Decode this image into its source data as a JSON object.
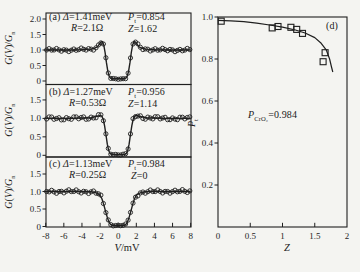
{
  "figure": {
    "background_color": "#f4f4f1",
    "ink_color": "#1f1f1f"
  },
  "axis_labels": {
    "left_y_html": "<i>G</i>(<i>V</i>)/<i>G</i><sub>n</sub>",
    "left_x_html": "<i>V</i>/mV",
    "d_y_html": "<i>P</i><sub>t</sub>",
    "d_x_html": "<i>Z</i>"
  },
  "chart_data": [
    {
      "type": "line",
      "panel": "a",
      "title_html": "(a) <i>Δ</i>=1.41meV",
      "pt_html": "<i>P</i><sub>t</sub>=0.854",
      "r_html": "<i>R</i>=2.1Ω",
      "z_html": "<i>Z</i>=1.62",
      "params": {
        "delta_meV": 1.41,
        "P_t": 0.854,
        "R_ohm": 2.1,
        "Z": 1.62
      },
      "xlabel": "V/mV",
      "ylabel": "G(V)/Gn",
      "xlim": [
        -8,
        8
      ],
      "ylim": [
        0,
        2.2
      ],
      "xticks": [
        -8,
        -6,
        -4,
        -2,
        0,
        2,
        4,
        6,
        8
      ],
      "xtick_labels": [
        "-8",
        "-6",
        "-4",
        "-2",
        "0",
        "2",
        "4",
        "6",
        "8"
      ],
      "yticks": [
        0,
        0.5,
        1,
        1.5,
        2
      ],
      "ytick_labels": [
        "0",
        "0.5",
        "1.0",
        "1.5",
        "2.0"
      ],
      "curve": [
        [
          -8,
          1.0
        ],
        [
          -7,
          1.0
        ],
        [
          -6,
          1.0
        ],
        [
          -5,
          1.0
        ],
        [
          -4,
          1.01
        ],
        [
          -3.5,
          1.02
        ],
        [
          -3,
          1.03
        ],
        [
          -2.6,
          1.06
        ],
        [
          -2.3,
          1.1
        ],
        [
          -2.05,
          1.2
        ],
        [
          -1.9,
          1.26
        ],
        [
          -1.75,
          1.27
        ],
        [
          -1.6,
          1.17
        ],
        [
          -1.45,
          0.92
        ],
        [
          -1.3,
          0.6
        ],
        [
          -1.15,
          0.32
        ],
        [
          -1.0,
          0.16
        ],
        [
          -0.85,
          0.09
        ],
        [
          -0.7,
          0.075
        ],
        [
          -0.5,
          0.07
        ],
        [
          0,
          0.07
        ],
        [
          0.5,
          0.07
        ],
        [
          0.7,
          0.075
        ],
        [
          0.85,
          0.09
        ],
        [
          1.0,
          0.16
        ],
        [
          1.15,
          0.32
        ],
        [
          1.3,
          0.6
        ],
        [
          1.45,
          0.92
        ],
        [
          1.6,
          1.17
        ],
        [
          1.75,
          1.27
        ],
        [
          1.9,
          1.26
        ],
        [
          2.05,
          1.2
        ],
        [
          2.3,
          1.1
        ],
        [
          2.6,
          1.06
        ],
        [
          3,
          1.03
        ],
        [
          3.5,
          1.02
        ],
        [
          4,
          1.01
        ],
        [
          5,
          1.0
        ],
        [
          6,
          1.0
        ],
        [
          7,
          1.0
        ],
        [
          8,
          1.0
        ]
      ]
    },
    {
      "type": "line",
      "panel": "b",
      "title_html": "(b) <i>Δ</i>=1.27meV",
      "pt_html": "<i>P</i><sub>t</sub>=0.956",
      "r_html": "<i>R</i>=0.53Ω",
      "z_html": "<i>Z</i>=1.14",
      "params": {
        "delta_meV": 1.27,
        "P_t": 0.956,
        "R_ohm": 0.53,
        "Z": 1.14
      },
      "xlabel": "V/mV",
      "ylabel": "G(V)/Gn",
      "xlim": [
        -8,
        8
      ],
      "ylim": [
        0,
        1.95
      ],
      "xticks": [
        -8,
        -6,
        -4,
        -2,
        0,
        2,
        4,
        6,
        8
      ],
      "xtick_labels": [
        "-8",
        "-6",
        "-4",
        "-2",
        "0",
        "2",
        "4",
        "6",
        "8"
      ],
      "yticks": [
        0,
        0.5,
        1,
        1.5
      ],
      "ytick_labels": [
        "0",
        "0.5",
        "1.0",
        "1.5"
      ],
      "curve": [
        [
          -8,
          1.0
        ],
        [
          -7,
          1.0
        ],
        [
          -6,
          1.0
        ],
        [
          -5,
          1.0
        ],
        [
          -4,
          1.01
        ],
        [
          -3,
          1.02
        ],
        [
          -2.6,
          1.04
        ],
        [
          -2.2,
          1.065
        ],
        [
          -2.0,
          1.08
        ],
        [
          -1.8,
          1.06
        ],
        [
          -1.65,
          0.97
        ],
        [
          -1.5,
          0.8
        ],
        [
          -1.35,
          0.55
        ],
        [
          -1.2,
          0.3
        ],
        [
          -1.05,
          0.13
        ],
        [
          -0.9,
          0.05
        ],
        [
          -0.7,
          0.025
        ],
        [
          -0.4,
          0.02
        ],
        [
          0,
          0.02
        ],
        [
          0.4,
          0.02
        ],
        [
          0.7,
          0.025
        ],
        [
          0.9,
          0.05
        ],
        [
          1.05,
          0.13
        ],
        [
          1.2,
          0.3
        ],
        [
          1.35,
          0.55
        ],
        [
          1.5,
          0.8
        ],
        [
          1.65,
          0.97
        ],
        [
          1.8,
          1.06
        ],
        [
          2.0,
          1.08
        ],
        [
          2.2,
          1.065
        ],
        [
          2.6,
          1.04
        ],
        [
          3,
          1.02
        ],
        [
          4,
          1.01
        ],
        [
          5,
          1.0
        ],
        [
          6,
          1.0
        ],
        [
          7,
          1.0
        ],
        [
          8,
          1.0
        ]
      ]
    },
    {
      "type": "line",
      "panel": "c",
      "title_html": "(c) <i>Δ</i>=1.13meV",
      "pt_html": "<i>P</i><sub>t</sub>=0.984",
      "r_html": "<i>R</i>=0.25Ω",
      "z_html": "<i>Z</i>=0",
      "params": {
        "delta_meV": 1.13,
        "P_t": 0.984,
        "R_ohm": 0.25,
        "Z": 0
      },
      "xlabel": "V/mV",
      "ylabel": "G(V)/Gn",
      "xlim": [
        -8,
        8
      ],
      "ylim": [
        0,
        2.0
      ],
      "xticks": [
        -8,
        -6,
        -4,
        -2,
        0,
        2,
        4,
        6,
        8
      ],
      "xtick_labels": [
        "-8",
        "-6",
        "-4",
        "-2",
        "0",
        "2",
        "4",
        "6",
        "8"
      ],
      "yticks": [
        0,
        0.5,
        1,
        1.5
      ],
      "ytick_labels": [
        "0",
        "0.5",
        "1.0",
        "1.5"
      ],
      "curve": [
        [
          -8,
          1.0
        ],
        [
          -7,
          1.0
        ],
        [
          -6,
          1.0
        ],
        [
          -5,
          1.0
        ],
        [
          -4,
          1.0
        ],
        [
          -3,
          0.99
        ],
        [
          -2.6,
          0.975
        ],
        [
          -2.3,
          0.95
        ],
        [
          -2.0,
          0.89
        ],
        [
          -1.8,
          0.79
        ],
        [
          -1.6,
          0.63
        ],
        [
          -1.4,
          0.44
        ],
        [
          -1.2,
          0.26
        ],
        [
          -1.0,
          0.12
        ],
        [
          -0.85,
          0.06
        ],
        [
          -0.65,
          0.035
        ],
        [
          -0.4,
          0.03
        ],
        [
          0,
          0.03
        ],
        [
          0.4,
          0.03
        ],
        [
          0.65,
          0.035
        ],
        [
          0.85,
          0.06
        ],
        [
          1.0,
          0.12
        ],
        [
          1.2,
          0.26
        ],
        [
          1.4,
          0.44
        ],
        [
          1.6,
          0.63
        ],
        [
          1.8,
          0.79
        ],
        [
          2.0,
          0.89
        ],
        [
          2.3,
          0.95
        ],
        [
          2.6,
          0.975
        ],
        [
          3,
          0.99
        ],
        [
          4,
          1.0
        ],
        [
          5,
          1.0
        ],
        [
          6,
          1.0
        ],
        [
          7,
          1.0
        ],
        [
          8,
          1.0
        ]
      ]
    },
    {
      "type": "scatter",
      "panel": "d",
      "label_html": "(d)",
      "annotation_html": "<i>P</i><sub>CrO₂</sub>=0.984",
      "annotation_text": "P_CrO2=0.984",
      "xlabel": "Z",
      "ylabel": "Pt",
      "xlim": [
        0,
        2
      ],
      "ylim": [
        0,
        1.05
      ],
      "xticks": [
        0,
        0.5,
        1,
        1.5,
        2
      ],
      "xtick_labels": [
        "0",
        "0.5",
        "1",
        "1.5",
        "2"
      ],
      "yticks": [
        0.2,
        0.4,
        0.6,
        0.8,
        1.0
      ],
      "ytick_labels": [
        "0.2",
        "0.4",
        "0.6",
        "0.8",
        "1.0"
      ],
      "squares": [
        [
          0.05,
          0.98
        ],
        [
          0.84,
          0.948
        ],
        [
          0.93,
          0.955
        ],
        [
          1.13,
          0.951
        ],
        [
          1.22,
          0.941
        ],
        [
          1.31,
          0.922
        ],
        [
          1.66,
          0.83
        ],
        [
          1.63,
          0.787
        ]
      ],
      "fit": [
        [
          0,
          0.984
        ],
        [
          0.2,
          0.982
        ],
        [
          0.4,
          0.978
        ],
        [
          0.6,
          0.971
        ],
        [
          0.8,
          0.962
        ],
        [
          1.0,
          0.952
        ],
        [
          1.2,
          0.938
        ],
        [
          1.35,
          0.924
        ],
        [
          1.5,
          0.902
        ],
        [
          1.6,
          0.875
        ],
        [
          1.68,
          0.842
        ],
        [
          1.73,
          0.8
        ],
        [
          1.76,
          0.762
        ],
        [
          1.78,
          0.738
        ]
      ]
    }
  ]
}
